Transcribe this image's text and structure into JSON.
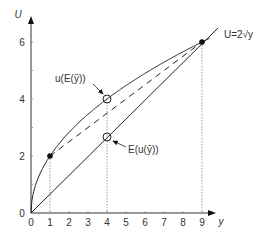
{
  "chart_data": {
    "type": "line",
    "title": "",
    "xlabel": "y",
    "ylabel": "U",
    "xlim": [
      0,
      9.5
    ],
    "ylim": [
      0,
      6.8
    ],
    "x_ticks": [
      "0",
      "1",
      "2",
      "3",
      "4",
      "5",
      "6",
      "7",
      "8",
      "9"
    ],
    "y_ticks": [
      "0",
      "2",
      "4",
      "6"
    ],
    "grid": false,
    "series": [
      {
        "name": "U=2√y",
        "style": "solid",
        "function": "U = 2*sqrt(y)",
        "x": [
          0,
          1,
          4,
          9
        ],
        "y": [
          0,
          2,
          4,
          6
        ]
      },
      {
        "name": "straight line",
        "style": "solid",
        "x": [
          0,
          4,
          9
        ],
        "y": [
          0,
          2.67,
          6
        ]
      },
      {
        "name": "chord",
        "style": "dashed",
        "x": [
          1,
          9
        ],
        "y": [
          2,
          6
        ]
      }
    ],
    "points": [
      {
        "x": 1,
        "y": 2,
        "marker": "filled"
      },
      {
        "x": 9,
        "y": 6,
        "marker": "filled"
      },
      {
        "x": 4,
        "y": 4,
        "marker": "open",
        "label": "u(E(ȳ))"
      },
      {
        "x": 4,
        "y": 2.67,
        "marker": "open",
        "label": "E(u(ȳ))"
      }
    ],
    "annotations": [
      "u(E(ȳ))",
      "E(u(ȳ))",
      "U=2√y"
    ]
  },
  "labels": {
    "y_axis": "U",
    "x_axis": "y",
    "curve": "U=2√y",
    "upper_point": "u(E(ȳ))",
    "lower_point": "E(u(ȳ))",
    "xticks": [
      "0",
      "1",
      "2",
      "3",
      "4",
      "5",
      "6",
      "7",
      "8",
      "9"
    ],
    "yticks": [
      "0",
      "2",
      "4",
      "6"
    ]
  }
}
